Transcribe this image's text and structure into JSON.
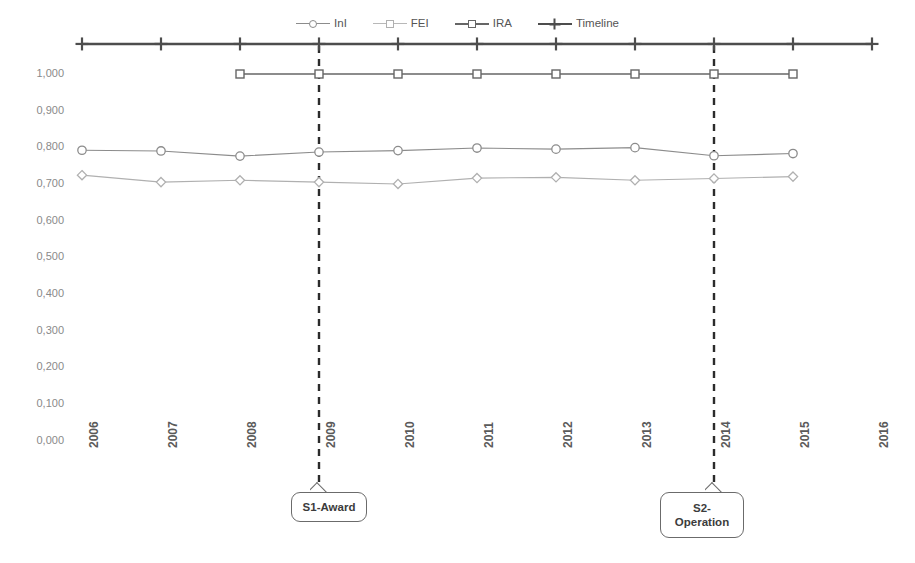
{
  "chart_data": {
    "type": "line",
    "title": "",
    "xlabel": "",
    "ylabel": "",
    "x": [
      2006,
      2007,
      2008,
      2009,
      2010,
      2011,
      2012,
      2013,
      2014,
      2015,
      2016
    ],
    "xticklabels": [
      "2006",
      "2007",
      "2008",
      "2009",
      "2010",
      "2011",
      "2012",
      "2013",
      "2014",
      "2015",
      "2016"
    ],
    "yticklabels": [
      "0,000",
      "0,100",
      "0,200",
      "0,300",
      "0,400",
      "0,500",
      "0,600",
      "0,700",
      "0,800",
      "0,900",
      "1,000"
    ],
    "yticks": [
      0.0,
      0.1,
      0.2,
      0.3,
      0.4,
      0.5,
      0.6,
      0.7,
      0.8,
      0.9,
      1.0
    ],
    "ylim": [
      0.0,
      1.0
    ],
    "grid": false,
    "legend_position": "top-center",
    "series": [
      {
        "name": "InI",
        "marker": "circle",
        "color": "#8c8c8c",
        "x": [
          2006,
          2007,
          2008,
          2009,
          2010,
          2011,
          2012,
          2013,
          2014,
          2015
        ],
        "values": [
          0.792,
          0.79,
          0.776,
          0.787,
          0.791,
          0.798,
          0.795,
          0.799,
          0.777,
          0.783
        ]
      },
      {
        "name": "FEI",
        "marker": "diamond",
        "color": "#b0b0b0",
        "x": [
          2006,
          2007,
          2008,
          2009,
          2010,
          2011,
          2012,
          2013,
          2014,
          2015
        ],
        "values": [
          0.724,
          0.705,
          0.71,
          0.705,
          0.7,
          0.716,
          0.718,
          0.71,
          0.715,
          0.72
        ]
      },
      {
        "name": "IRA",
        "marker": "square",
        "color": "#666666",
        "x": [
          2008,
          2009,
          2010,
          2011,
          2012,
          2013,
          2014,
          2015
        ],
        "values": [
          1.0,
          1.0,
          1.0,
          1.0,
          1.0,
          1.0,
          1.0,
          1.0
        ]
      },
      {
        "name": "Timeline",
        "marker": "plus",
        "color": "#4d4d4d",
        "x": [
          2006,
          2007,
          2008,
          2009,
          2010,
          2011,
          2012,
          2013,
          2014,
          2015,
          2016
        ],
        "values": [
          1.082,
          1.082,
          1.082,
          1.082,
          1.082,
          1.082,
          1.082,
          1.082,
          1.082,
          1.082,
          1.082
        ]
      }
    ],
    "annotations": [
      {
        "label": "S1-Award",
        "x": 2009,
        "style": "dashed-vertical-callout"
      },
      {
        "label": "S2-\nOperation",
        "label_line1": "S2-",
        "label_line2": "Operation",
        "x": 2014,
        "style": "dashed-vertical-callout"
      }
    ]
  },
  "legend": {
    "items": [
      {
        "label": "InI"
      },
      {
        "label": "FEI"
      },
      {
        "label": "IRA"
      },
      {
        "label": "Timeline"
      }
    ]
  },
  "colors": {
    "ini": "#8c8c8c",
    "fei": "#b0b0b0",
    "ira": "#666666",
    "timeline": "#4d4d4d",
    "axis_text": "#8a8a8a",
    "xaxis_text": "#5a5a5a",
    "annotation_line": "#2b2b2b"
  }
}
